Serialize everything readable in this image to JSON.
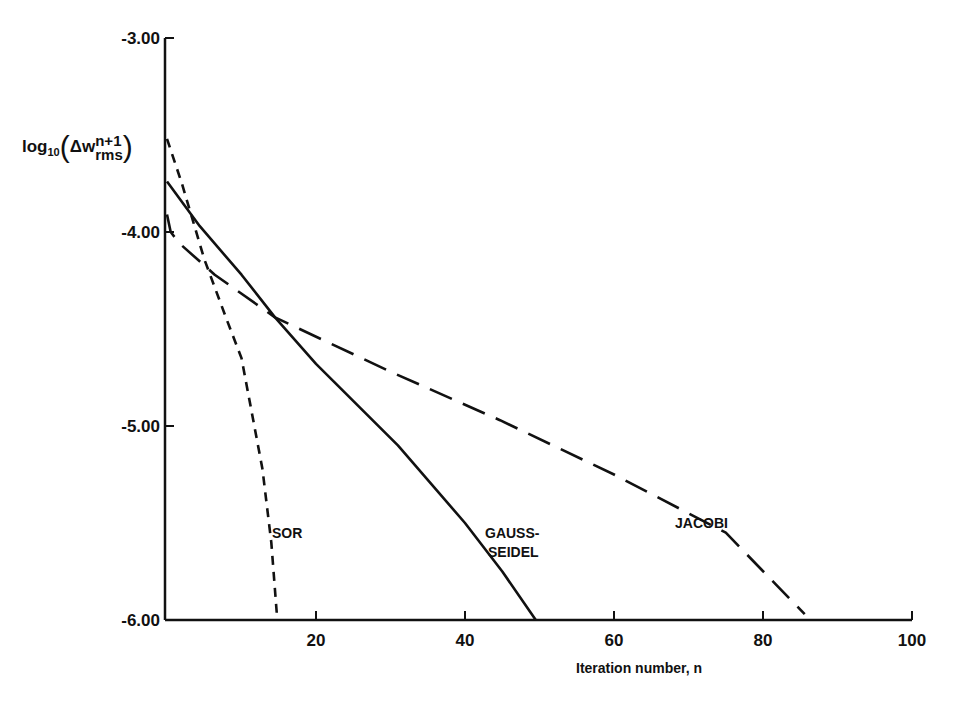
{
  "chart_data": {
    "type": "line",
    "title": "",
    "xlabel": "Iteration number, n",
    "ylabel": {
      "prefix": "log",
      "subscript": "10",
      "open_paren": "(",
      "symbol": "Δw",
      "superscript": "n+1",
      "subscript2": "rms",
      "close_paren": ")"
    },
    "xlim": [
      0,
      100
    ],
    "ylim": [
      -6.0,
      -3.0
    ],
    "x_ticks": [
      "20",
      "40",
      "60",
      "80",
      "100"
    ],
    "y_ticks": [
      "-3.00",
      "-4.00",
      "-5.00",
      "-6.00"
    ],
    "grid": false,
    "legend": "inline labels",
    "series": [
      {
        "name": "SOR",
        "style": "short-dash",
        "x": [
          0,
          2,
          5,
          8,
          10,
          12.8,
          14,
          14.8
        ],
        "y": [
          -3.52,
          -3.75,
          -4.14,
          -4.45,
          -4.65,
          -5.22,
          -5.6,
          -6.0
        ]
      },
      {
        "name": "GAUSS-SEIDEL",
        "label_lines": [
          "GAUSS-",
          "SEIDEL"
        ],
        "style": "solid",
        "x": [
          0,
          4.4,
          10,
          14.5,
          20,
          31,
          40,
          45,
          49.5
        ],
        "y": [
          -3.74,
          -3.97,
          -4.22,
          -4.44,
          -4.68,
          -5.1,
          -5.5,
          -5.75,
          -6.0
        ]
      },
      {
        "name": "JACOBI",
        "style": "long-dash",
        "x": [
          0,
          0.5,
          1.7,
          6.4,
          14.5,
          30,
          44.7,
          60,
          75,
          85.6
        ],
        "y": [
          -3.91,
          -4.0,
          -4.06,
          -4.22,
          -4.44,
          -4.72,
          -4.97,
          -5.25,
          -5.55,
          -5.97
        ]
      }
    ]
  }
}
